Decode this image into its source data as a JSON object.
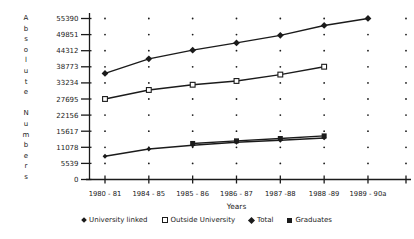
{
  "page": {
    "background": "#ffffff",
    "ink": "#1b1b1b"
  },
  "chart_data": {
    "type": "line",
    "title": "",
    "xlabel": "Years",
    "ylabel": "Absolute Numbers",
    "x_categories": [
      "1980 - 81",
      "1984 - 85",
      "1985 - 86",
      "1986 - 87",
      "1987 -88",
      "1988 -89",
      "1989 - 90a"
    ],
    "y_tick_labels": [
      "0",
      "5539",
      "11078",
      "15617",
      "22156",
      "27695",
      "33234",
      "38773",
      "44312",
      "49851",
      "55390"
    ],
    "ylim": [
      0,
      55390
    ],
    "grid": "dot at each category/tick intersection",
    "legend_position": "bottom",
    "series": [
      {
        "name": "University linked",
        "marker": "small-filled-diamond",
        "values": [
          8000,
          10500,
          11800,
          12800,
          13500,
          14300,
          null
        ]
      },
      {
        "name": "Outside University",
        "marker": "open-square",
        "values": [
          27700,
          30800,
          32600,
          33900,
          36100,
          38800,
          null
        ]
      },
      {
        "name": "Total",
        "marker": "filled-diamond",
        "values": [
          36500,
          41500,
          44500,
          47000,
          49600,
          53000,
          55400
        ]
      },
      {
        "name": "Graduates",
        "marker": "filled-square",
        "values": [
          null,
          null,
          12400,
          13300,
          14100,
          15000,
          null
        ]
      }
    ]
  }
}
